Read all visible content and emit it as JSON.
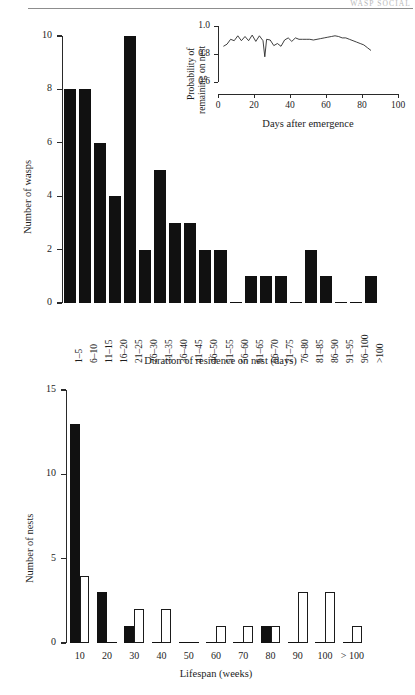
{
  "running_head": {
    "text": "WASP SOCIAL"
  },
  "figures": [
    {
      "id": "top",
      "ylabel": "Number of wasps",
      "xlabel": "Duration of residence on nest (days)"
    },
    {
      "id": "bottom",
      "ylabel": "Number of nests",
      "xlabel": "Lifespan (weeks)"
    }
  ],
  "inset": {
    "ylabel_line1": "Probability of",
    "ylabel_line2": "remaining on nest",
    "xlabel": "Days after emergence"
  },
  "chart_data": [
    {
      "type": "bar",
      "id": "duration-of-residence",
      "title": "",
      "xlabel": "Duration of residence on nest (days)",
      "ylabel": "Number of wasps",
      "ylim": [
        0,
        10
      ],
      "yticks": [
        0,
        2,
        4,
        6,
        8,
        10
      ],
      "ytick_labels": [
        "0",
        "2",
        "4",
        "6",
        "8",
        "10"
      ],
      "grid": false,
      "legend": "none",
      "bar_style": "filled",
      "categories": [
        "1–5",
        "6–10",
        "11–15",
        "16–20",
        "21–25",
        "26–30",
        "31–35",
        "36–40",
        "41–45",
        "46–50",
        "51–55",
        "56–60",
        "61–65",
        "66–70",
        "71–75",
        "76–80",
        "81–85",
        "86–90",
        "91–95",
        "96–100",
        ">100"
      ],
      "values": [
        8,
        8,
        6,
        4,
        10,
        2,
        5,
        3,
        3,
        2,
        2,
        0,
        1,
        1,
        1,
        0,
        2,
        1,
        0,
        0,
        1
      ]
    },
    {
      "type": "line",
      "id": "probability-remaining-on-nest",
      "title": "",
      "xlabel": "Days after emergence",
      "ylabel": "Probability of remaining on nest",
      "xlim": [
        0,
        100
      ],
      "ylim": [
        0.6,
        1.0
      ],
      "xticks": [
        0,
        20,
        40,
        60,
        80,
        100
      ],
      "xtick_labels": [
        "0",
        "20",
        "40",
        "60",
        "80",
        "100"
      ],
      "yticks": [
        0.6,
        0.8,
        1.0
      ],
      "ytick_labels": [
        "0.6",
        "0.8",
        "1.0"
      ],
      "grid": false,
      "legend": "none",
      "x": [
        3,
        5,
        7,
        9,
        11,
        13,
        15,
        17,
        19,
        21,
        23,
        25,
        26,
        27,
        29,
        31,
        33,
        35,
        37,
        39,
        41,
        43,
        45,
        47,
        49,
        51,
        53,
        55,
        57,
        59,
        61,
        63,
        65,
        67,
        69,
        71,
        73,
        75,
        77,
        79,
        81,
        83,
        85
      ],
      "y": [
        0.855,
        0.87,
        0.905,
        0.895,
        0.93,
        0.895,
        0.925,
        0.895,
        0.935,
        0.89,
        0.93,
        0.895,
        0.78,
        0.905,
        0.9,
        0.86,
        0.875,
        0.855,
        0.9,
        0.915,
        0.89,
        0.915,
        0.905,
        0.905,
        0.905,
        0.905,
        0.9,
        0.905,
        0.91,
        0.915,
        0.92,
        0.925,
        0.93,
        0.925,
        0.915,
        0.915,
        0.905,
        0.895,
        0.885,
        0.875,
        0.865,
        0.845,
        0.825
      ]
    },
    {
      "type": "bar",
      "id": "nest-lifespan",
      "title": "",
      "xlabel": "Lifespan (weeks)",
      "ylabel": "Number of nests",
      "ylim": [
        0,
        15
      ],
      "yticks": [
        0,
        5,
        10,
        15
      ],
      "ytick_labels": [
        "0",
        "5",
        "10",
        "15"
      ],
      "grid": false,
      "legend": "none",
      "categories": [
        "10",
        "20",
        "30",
        "40",
        "50",
        "60",
        "70",
        "80",
        "90",
        "100",
        "> 100"
      ],
      "series": [
        {
          "name": "filled",
          "style": "filled",
          "values": [
            13,
            3,
            1,
            0,
            0,
            0,
            0,
            1,
            0,
            0,
            0
          ]
        },
        {
          "name": "open",
          "style": "open",
          "values": [
            4,
            0,
            2,
            2,
            0,
            1,
            1,
            1,
            3,
            3,
            1
          ]
        }
      ]
    }
  ]
}
